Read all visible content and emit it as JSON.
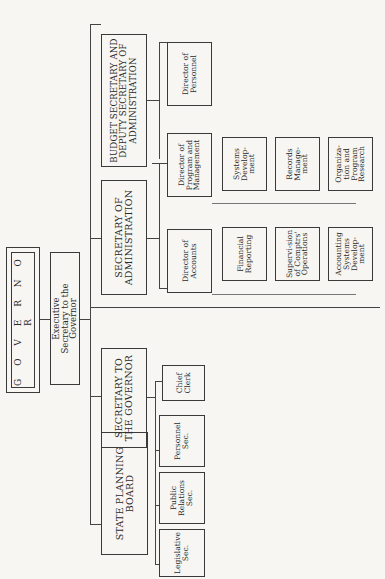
{
  "page": {
    "number": "274"
  },
  "chart": {
    "governor": "G O V E R N O R",
    "executive_secretary": "Executive Secretary to the Governor",
    "departments": "Departments, Boards, and Commissions",
    "branches": [
      {
        "title": "STATE PLANNING BOARD",
        "children": []
      },
      {
        "title": "SECRETARY TO THE GOVERNOR",
        "children": [
          "Legislative Sec.",
          "Public Relations Sec.",
          "Personnel Sec.",
          "Chief Clerk"
        ]
      },
      {
        "title": "SECRETARY OF ADMINISTRATION",
        "children": [
          {
            "title": "Director of Accounts",
            "units": [
              "Financial Reporting",
              "Supervi-sion of Comptrs' Operations",
              "Accounting Systems Develop-ment"
            ]
          },
          {
            "title": "Director of Program and Management",
            "units": [
              "Systems Develop-ment",
              "Records Manage-ment",
              "Organiza-tion and Program Research"
            ]
          }
        ]
      },
      {
        "title": "BUDGET SECRETARY AND DEPUTY SECRETARY OF ADMINISTRATION",
        "children": [
          {
            "title": "Director of Personnel",
            "units": [
              "Personnel Transac-tions Control",
              "Classifica-tion and Pay",
              "Training"
            ]
          },
          {
            "title": "Budget Secretary",
            "units": [
              "Budget Examina-tion",
              "Procure-ment Comp-troller"
            ]
          }
        ]
      }
    ]
  }
}
